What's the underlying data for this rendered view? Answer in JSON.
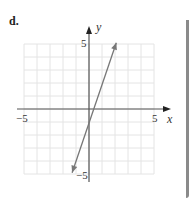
{
  "problem": {
    "label": "d."
  },
  "chart_data": {
    "type": "line",
    "title": "",
    "xlabel": "x",
    "ylabel": "y",
    "xlim": [
      -5,
      5
    ],
    "ylim": [
      -5,
      5
    ],
    "grid": true,
    "tick_labels": {
      "x_min": "−5",
      "x_max": "5",
      "y_max": "5",
      "y_min": "−5"
    },
    "series": [
      {
        "name": "line",
        "equation": "y = 3x - 1",
        "x": [
          -1.3,
          2.1
        ],
        "y": [
          -4.9,
          5.1
        ],
        "arrows": "both",
        "color": "#777777"
      }
    ]
  },
  "colors": {
    "axis": "#555555",
    "grid": "#e4e4e4",
    "line": "#777777",
    "border": "#8a8a8a"
  }
}
